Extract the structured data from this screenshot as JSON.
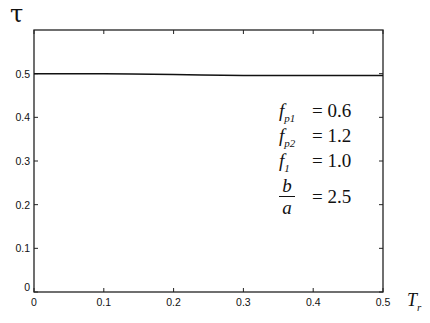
{
  "chart_data": {
    "type": "line",
    "title": "",
    "xlabel": "T_r",
    "ylabel": "τ",
    "xlim": [
      0,
      0.5
    ],
    "ylim": [
      0,
      0.6
    ],
    "xticks": [
      0,
      0.1,
      0.2,
      0.3,
      0.4,
      0.5
    ],
    "xtick_labels": [
      "0",
      "0.1",
      "0.2",
      "0.3",
      "0.4",
      "0.5"
    ],
    "yticks": [
      0,
      0.1,
      0.2,
      0.3,
      0.4,
      0.5
    ],
    "ytick_labels": [
      "0",
      "0.1",
      "0.2",
      "0.3",
      "0.4",
      "0.5"
    ],
    "grid": false,
    "series": [
      {
        "name": "tau",
        "x": [
          0,
          0.1,
          0.14,
          0.2,
          0.24,
          0.3,
          0.34,
          0.4,
          0.5
        ],
        "values": [
          0.5,
          0.5,
          0.499,
          0.498,
          0.497,
          0.496,
          0.496,
          0.496,
          0.496
        ]
      }
    ],
    "annotations": [
      {
        "name": "f",
        "sub": "p1",
        "value": "0.6"
      },
      {
        "name": "f",
        "sub": "p2",
        "value": "1.2"
      },
      {
        "name": "f",
        "sub": "1",
        "value": "1.0"
      },
      {
        "name": "b/a",
        "value": "2.5"
      }
    ]
  },
  "labels": {
    "y_axis": "τ",
    "x_axis_main": "T",
    "x_axis_sub": "r",
    "params": {
      "fp1_name": "f",
      "fp1_sub": "p1",
      "fp1_eq": "= 0.6",
      "fp2_name": "f",
      "fp2_sub": "p2",
      "fp2_eq": "= 1.2",
      "f1_name": "f",
      "f1_sub": "1",
      "f1_eq": "= 1.0",
      "ba_num": "b",
      "ba_den": "a",
      "ba_eq": "= 2.5"
    }
  }
}
